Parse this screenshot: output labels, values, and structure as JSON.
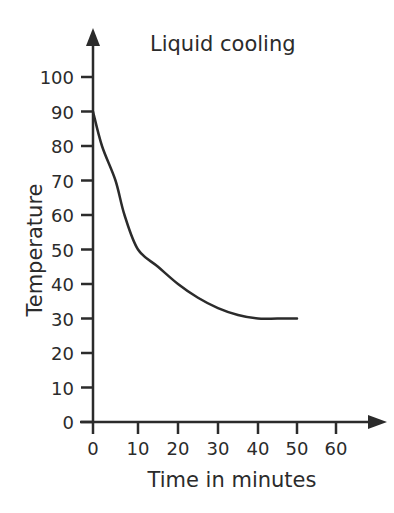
{
  "chart_data": {
    "type": "line",
    "title": "Liquid cooling",
    "xlabel": "Time in minutes",
    "ylabel": "Temperature",
    "xlim": [
      0,
      60
    ],
    "ylim": [
      0,
      100
    ],
    "x_ticks": [
      0,
      10,
      20,
      30,
      40,
      50,
      60
    ],
    "y_ticks": [
      0,
      10,
      20,
      30,
      40,
      50,
      60,
      70,
      80,
      90,
      100
    ],
    "grid": false,
    "legend": null,
    "series": [
      {
        "name": "Temperature",
        "x": [
          0,
          2,
          5,
          7,
          10,
          15,
          20,
          25,
          30,
          35,
          40,
          45,
          50
        ],
        "y": [
          90,
          80,
          70,
          60,
          50,
          45,
          40,
          36,
          33,
          31,
          30,
          30,
          30
        ]
      }
    ],
    "line_color": "#2b2b2b"
  }
}
